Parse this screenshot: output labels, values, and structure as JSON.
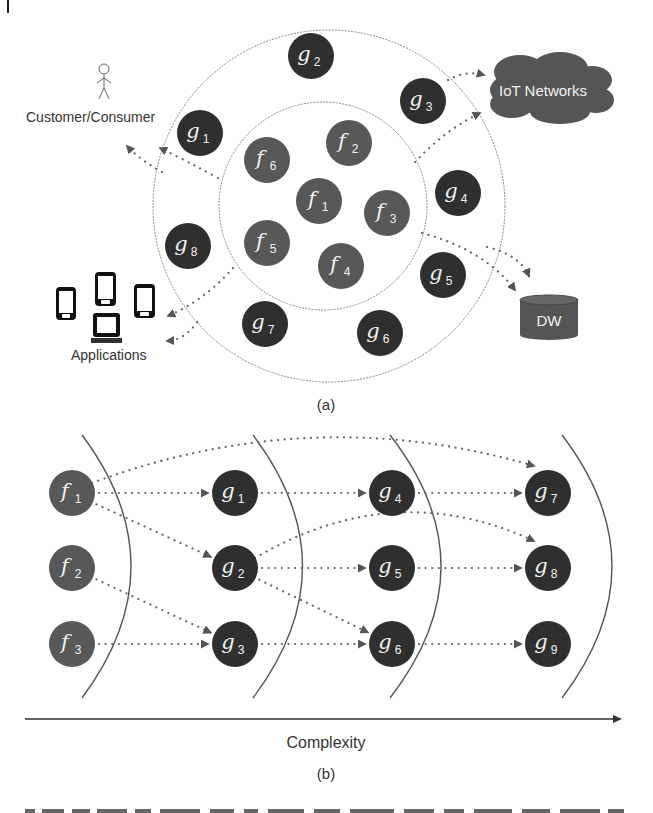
{
  "figure": {
    "margin_mark": "|",
    "panel_a": {
      "caption": "(a)",
      "outer_ring": {
        "cx": 329,
        "cy": 206,
        "r": 176
      },
      "inner_ring": {
        "cx": 323,
        "cy": 206,
        "r": 104
      },
      "colors": {
        "f_node": "#585858",
        "g_node": "#2f2f2f",
        "cloud": "#555555",
        "dw": "#555555"
      },
      "nodes": [
        {
          "id": "g2",
          "letter": "g",
          "sub": "2",
          "x": 311,
          "y": 56,
          "kind": "g"
        },
        {
          "id": "g3",
          "letter": "g",
          "sub": "3",
          "x": 423,
          "y": 101,
          "kind": "g"
        },
        {
          "id": "g1",
          "letter": "g",
          "sub": "1",
          "x": 200,
          "y": 133,
          "kind": "g"
        },
        {
          "id": "g4",
          "letter": "g",
          "sub": "4",
          "x": 458,
          "y": 193,
          "kind": "g"
        },
        {
          "id": "g8",
          "letter": "g",
          "sub": "8",
          "x": 188,
          "y": 246,
          "kind": "g"
        },
        {
          "id": "g5",
          "letter": "g",
          "sub": "5",
          "x": 443,
          "y": 275,
          "kind": "g"
        },
        {
          "id": "g7",
          "letter": "g",
          "sub": "7",
          "x": 265,
          "y": 324,
          "kind": "g"
        },
        {
          "id": "g6",
          "letter": "g",
          "sub": "6",
          "x": 380,
          "y": 333,
          "kind": "g"
        },
        {
          "id": "f6",
          "letter": "f",
          "sub": "6",
          "x": 267,
          "y": 160,
          "kind": "f"
        },
        {
          "id": "f2",
          "letter": "f",
          "sub": "2",
          "x": 349,
          "y": 143,
          "kind": "f"
        },
        {
          "id": "f1",
          "letter": "f",
          "sub": "1",
          "x": 319,
          "y": 201,
          "kind": "f"
        },
        {
          "id": "f3",
          "letter": "f",
          "sub": "3",
          "x": 387,
          "y": 213,
          "kind": "f"
        },
        {
          "id": "f5",
          "letter": "f",
          "sub": "5",
          "x": 267,
          "y": 243,
          "kind": "f"
        },
        {
          "id": "f4",
          "letter": "f",
          "sub": "4",
          "x": 341,
          "y": 266,
          "kind": "f"
        }
      ],
      "external": {
        "customer_label": "Customer/Consumer",
        "iot_label": "IoT Networks",
        "dw_label": "DW",
        "applications_label": "Applications"
      }
    },
    "panel_b": {
      "caption": "(b)",
      "axis_label": "Complexity",
      "colors": {
        "f_node": "#585858",
        "g_node": "#2f2f2f"
      },
      "nodes": [
        {
          "id": "f1",
          "letter": "f",
          "sub": "1",
          "x": 72,
          "y": 493,
          "kind": "f"
        },
        {
          "id": "f2",
          "letter": "f",
          "sub": "2",
          "x": 72,
          "y": 568,
          "kind": "f"
        },
        {
          "id": "f3",
          "letter": "f",
          "sub": "3",
          "x": 72,
          "y": 644,
          "kind": "f"
        },
        {
          "id": "g1",
          "letter": "g",
          "sub": "1",
          "x": 235,
          "y": 493,
          "kind": "g"
        },
        {
          "id": "g2",
          "letter": "g",
          "sub": "2",
          "x": 235,
          "y": 568,
          "kind": "g"
        },
        {
          "id": "g3",
          "letter": "g",
          "sub": "3",
          "x": 235,
          "y": 644,
          "kind": "g"
        },
        {
          "id": "g4",
          "letter": "g",
          "sub": "4",
          "x": 392,
          "y": 493,
          "kind": "g"
        },
        {
          "id": "g5",
          "letter": "g",
          "sub": "5",
          "x": 392,
          "y": 568,
          "kind": "g"
        },
        {
          "id": "g6",
          "letter": "g",
          "sub": "6",
          "x": 392,
          "y": 644,
          "kind": "g"
        },
        {
          "id": "g7",
          "letter": "g",
          "sub": "7",
          "x": 548,
          "y": 493,
          "kind": "g"
        },
        {
          "id": "g8",
          "letter": "g",
          "sub": "8",
          "x": 548,
          "y": 568,
          "kind": "g"
        },
        {
          "id": "g9",
          "letter": "g",
          "sub": "9",
          "x": 548,
          "y": 644,
          "kind": "g"
        }
      ],
      "edges": [
        {
          "from": "f1",
          "to": "g1"
        },
        {
          "from": "f1",
          "to": "g2"
        },
        {
          "from": "f1",
          "to": "g7",
          "curved": true
        },
        {
          "from": "f2",
          "to": "g3"
        },
        {
          "from": "f3",
          "to": "g3"
        },
        {
          "from": "g1",
          "to": "g4"
        },
        {
          "from": "g2",
          "to": "g5"
        },
        {
          "from": "g2",
          "to": "g6"
        },
        {
          "from": "g2",
          "to": "g8",
          "curved": true
        },
        {
          "from": "g3",
          "to": "g6"
        },
        {
          "from": "g4",
          "to": "g7"
        },
        {
          "from": "g5",
          "to": "g8"
        },
        {
          "from": "g6",
          "to": "g9"
        }
      ]
    },
    "bottom_cut_text": "Figure caption (cut off)"
  }
}
